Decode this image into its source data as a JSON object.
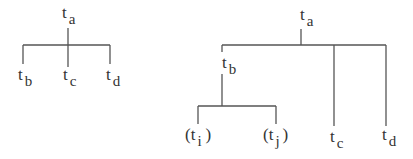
{
  "trees": [
    {
      "name": "left-tree",
      "root": {
        "base": "t",
        "sub": "a"
      },
      "children": [
        {
          "base": "t",
          "sub": "b"
        },
        {
          "base": "t",
          "sub": "c"
        },
        {
          "base": "t",
          "sub": "d"
        }
      ]
    },
    {
      "name": "right-tree",
      "root": {
        "base": "t",
        "sub": "a"
      },
      "children": [
        {
          "base": "t",
          "sub": "b",
          "children": [
            {
              "open": "(",
              "base": "t",
              "sub": "i",
              "close": ")"
            },
            {
              "open": "(",
              "base": "t",
              "sub": "j",
              "close": ")"
            }
          ]
        },
        {
          "base": "t",
          "sub": "c"
        },
        {
          "base": "t",
          "sub": "d"
        }
      ]
    }
  ],
  "line_color": "#555555"
}
